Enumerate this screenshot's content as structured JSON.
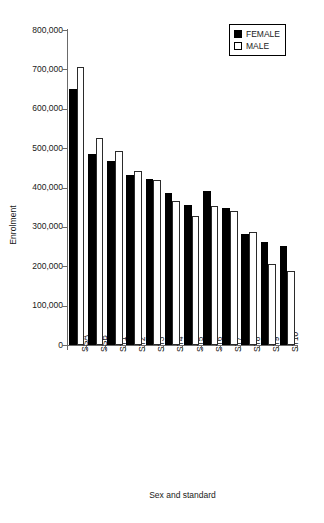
{
  "chart_data": {
    "type": "bar",
    "title": "",
    "xlabel": "Sex and standard",
    "ylabel": "Enrolment",
    "categories": [
      "SSA",
      "SSB",
      "ST1",
      "ST2",
      "ST3",
      "ST4",
      "ST5",
      "ST6",
      "ST7",
      "ST8",
      "ST9",
      "ST10"
    ],
    "series": [
      {
        "name": "FEMALE",
        "color": "#000000",
        "values": [
          650000,
          485000,
          467000,
          432000,
          422000,
          385000,
          355000,
          390000,
          348000,
          282000,
          262000,
          251000
        ]
      },
      {
        "name": "MALE",
        "color": "#ffffff",
        "values": [
          705000,
          525000,
          494000,
          441000,
          418000,
          365000,
          327000,
          352000,
          340000,
          287000,
          205000,
          189000
        ]
      }
    ],
    "ylim": [
      0,
      800000
    ],
    "ytick_values": [
      0,
      100000,
      200000,
      300000,
      400000,
      500000,
      600000,
      700000,
      800000
    ],
    "ytick_labels": [
      "0",
      "100,000",
      "200,000",
      "300,000",
      "400,000",
      "500,000",
      "600,000",
      "700,000",
      "800,000"
    ],
    "grid": false,
    "legend_position": "top-right",
    "legend_entries": [
      "FEMALE",
      "MALE"
    ]
  }
}
